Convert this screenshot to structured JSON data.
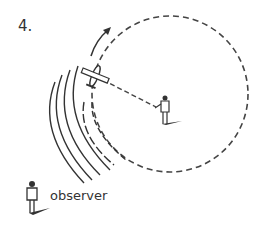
{
  "figure": {
    "number_label": "4.",
    "observer_label": "observer",
    "colors": {
      "ink": "#333333",
      "dash": "#444444",
      "background": "#ffffff"
    },
    "elements": {
      "flight_path": "dashed circle",
      "aircraft": "airplane-icon",
      "pilot_figure": "person-icon at circle center holding line to aircraft",
      "observer_figure": "person-icon lower left",
      "sound_waves": "concentric arcs toward observer",
      "direction": "arrow indicating counter-clockwise motion"
    }
  }
}
